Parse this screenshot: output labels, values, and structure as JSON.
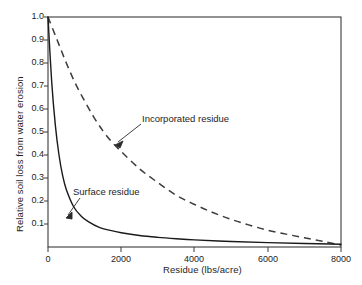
{
  "chart_data": {
    "type": "line",
    "title": "",
    "subtitle": "",
    "xlabel": "Residue (lbs/acre)",
    "ylabel": "Relative soil loss from water erosion",
    "xlim": [
      0,
      8000
    ],
    "ylim": [
      0,
      1.0
    ],
    "xticks": [
      0,
      2000,
      4000,
      6000,
      8000
    ],
    "xtick_labels": [
      "0",
      "2000",
      "4000",
      "6000",
      "8000"
    ],
    "yticks": [
      0.1,
      0.2,
      0.3,
      0.4,
      0.5,
      0.6,
      0.7,
      0.8,
      0.9,
      1.0
    ],
    "ytick_labels": [
      "0.1",
      "0.2",
      "0.3",
      "0.4",
      "0.5",
      "0.6",
      "0.7",
      "0.8",
      "0.9",
      "1.0"
    ],
    "grid": false,
    "legend_position": "inline-annotations",
    "series": [
      {
        "name": "Surface residue",
        "style": "solid",
        "color": "#1a1a1a",
        "x": [
          0,
          100,
          200,
          300,
          400,
          500,
          700,
          900,
          1100,
          1400,
          1700,
          2000,
          2500,
          3000,
          3500,
          4000,
          5000,
          6000,
          7000,
          8000
        ],
        "values": [
          1.0,
          0.72,
          0.53,
          0.4,
          0.31,
          0.25,
          0.175,
          0.135,
          0.11,
          0.085,
          0.072,
          0.062,
          0.05,
          0.042,
          0.036,
          0.031,
          0.024,
          0.019,
          0.015,
          0.012
        ]
      },
      {
        "name": "Incorporated residue",
        "style": "dashed",
        "color": "#3c3c3c",
        "x": [
          0,
          250,
          500,
          750,
          1000,
          1250,
          1500,
          1750,
          2000,
          2500,
          3000,
          3500,
          4000,
          4500,
          5000,
          5500,
          6000,
          6500,
          7000,
          7500,
          8000
        ],
        "values": [
          1.0,
          0.9,
          0.8,
          0.71,
          0.635,
          0.565,
          0.505,
          0.455,
          0.415,
          0.34,
          0.28,
          0.225,
          0.185,
          0.15,
          0.12,
          0.095,
          0.073,
          0.056,
          0.04,
          0.025,
          0.008
        ]
      }
    ],
    "annotations": [
      {
        "text": "Incorporated residue",
        "target_x": 1750,
        "target_y": 0.46
      },
      {
        "text": "Surface residue",
        "target_x": 1000,
        "target_y": 0.105
      }
    ]
  }
}
